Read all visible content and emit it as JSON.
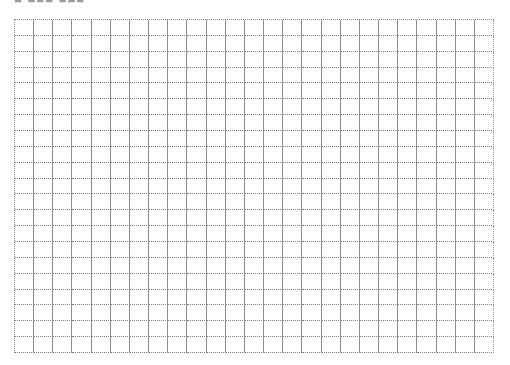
{
  "header": {
    "title_clipped": "■ ■■■ ■■■"
  },
  "grid": {
    "columns": 25,
    "rows": 21,
    "vertical_line_style": "solid",
    "horizontal_line_style": "dotted",
    "line_color": "#8c8c8c",
    "background": "#ffffff"
  }
}
